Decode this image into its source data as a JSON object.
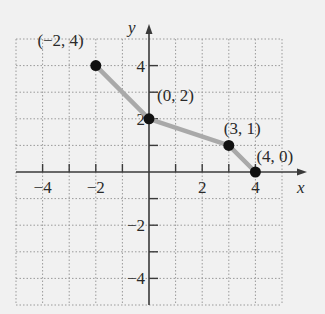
{
  "chart_data": {
    "type": "line",
    "title": "",
    "xlabel": "x",
    "ylabel": "y",
    "xlim": [
      -5,
      5
    ],
    "ylim": [
      -5,
      5
    ],
    "grid": true,
    "x_ticks": [
      -4,
      -3,
      -2,
      -1,
      1,
      2,
      3,
      4
    ],
    "x_tick_labels": [
      {
        "value": -4,
        "label": "−4"
      },
      {
        "value": -2,
        "label": "−2"
      },
      {
        "value": 2,
        "label": "2"
      },
      {
        "value": 4,
        "label": "4"
      }
    ],
    "y_ticks": [
      -4,
      -3,
      -2,
      -1,
      1,
      2,
      3,
      4
    ],
    "y_tick_labels": [
      {
        "value": 4,
        "label": "4"
      },
      {
        "value": 2,
        "label": "2"
      },
      {
        "value": -2,
        "label": "−2"
      },
      {
        "value": -4,
        "label": "−4"
      }
    ],
    "series": [
      {
        "name": "piecewise path",
        "color": "#a9a9a9",
        "points": [
          {
            "x": -2,
            "y": 4,
            "label": "(−2, 4)"
          },
          {
            "x": 0,
            "y": 2,
            "label": "(0, 2)"
          },
          {
            "x": 3,
            "y": 1,
            "label": "(3, 1)"
          },
          {
            "x": 4,
            "y": 0,
            "label": "(4, 0)"
          }
        ]
      }
    ]
  },
  "colors": {
    "background": "#f1f1f1",
    "axis": "#3a3a3a",
    "grid": "#9a9a9a",
    "line": "#a9a9a9",
    "point": "#111111"
  }
}
